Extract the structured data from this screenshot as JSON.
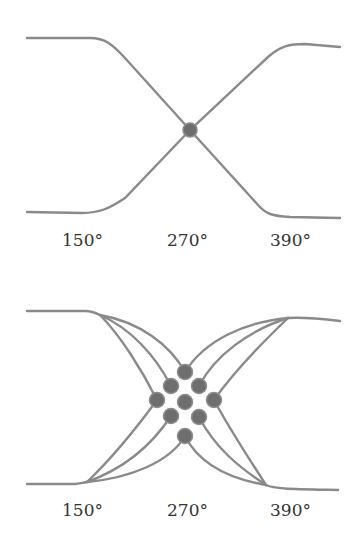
{
  "diagrams": [
    {
      "name": "single-crossing",
      "labels": [
        "150°",
        "270°",
        "390°"
      ],
      "crossing_points": 1
    },
    {
      "name": "multiple-crossings",
      "labels": [
        "150°",
        "270°",
        "390°"
      ],
      "crossing_points": 9
    }
  ],
  "colors": {
    "line": "#8a8a8a",
    "dot": "#6e6e6e",
    "text": "#333333",
    "background": "#ffffff"
  }
}
